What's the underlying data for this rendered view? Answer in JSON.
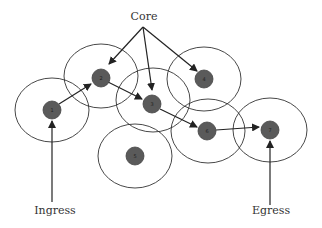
{
  "labels": {
    "core": "Core",
    "ingress": "Ingress",
    "egress": "Egress"
  },
  "colors": {
    "node_fill": "#5a5a5a",
    "line": "#222222",
    "range": "#333333"
  },
  "nodes": [
    {
      "id": "1",
      "x": 52,
      "y": 110
    },
    {
      "id": "2",
      "x": 101,
      "y": 78
    },
    {
      "id": "3",
      "x": 152,
      "y": 104
    },
    {
      "id": "4",
      "x": 204,
      "y": 79
    },
    {
      "id": "5",
      "x": 135,
      "y": 156
    },
    {
      "id": "6",
      "x": 207,
      "y": 131
    },
    {
      "id": "7",
      "x": 270,
      "y": 130
    }
  ],
  "path": [
    "1",
    "2",
    "3",
    "6",
    "7"
  ],
  "core_targets": [
    "2",
    "3",
    "4"
  ]
}
